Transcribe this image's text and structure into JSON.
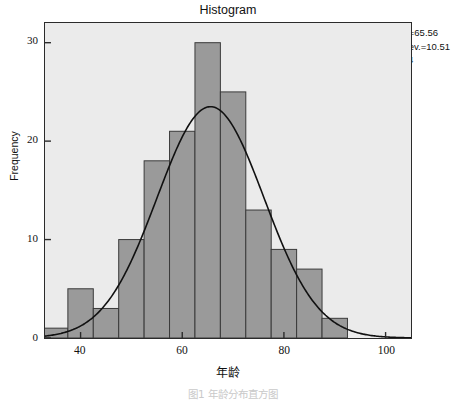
{
  "title": "Histogram",
  "stats": {
    "mean_label": "Mean=65.56",
    "stddev_label": "Std.Dev.=10.51",
    "n_label": "N=124"
  },
  "caption": "图1  年龄分布直方图",
  "colors": {
    "panel_background": "#ebebeb",
    "bar_fill": "#9a9a9a",
    "bar_stroke": "#3a3a3a",
    "curve": "#111111",
    "axis": "#2b2b2b",
    "text": "#111111"
  },
  "chart_data": {
    "type": "bar",
    "title": "Histogram",
    "xlabel": "年龄",
    "ylabel": "Frequency",
    "xlim": [
      33,
      105
    ],
    "ylim": [
      0,
      32
    ],
    "xticks": [
      40,
      60,
      80,
      100
    ],
    "yticks": [
      0,
      10,
      20,
      30
    ],
    "grid": false,
    "legend": false,
    "bin_width": 5,
    "bin_edges": [
      32.5,
      37.5,
      42.5,
      47.5,
      52.5,
      57.5,
      62.5,
      67.5,
      72.5,
      77.5,
      82.5,
      87.5,
      92.5
    ],
    "categories": [
      "32.5-37.5",
      "37.5-42.5",
      "42.5-47.5",
      "47.5-52.5",
      "52.5-57.5",
      "57.5-62.5",
      "62.5-67.5",
      "67.5-72.5",
      "72.5-77.5",
      "77.5-82.5",
      "82.5-87.5",
      "87.5-92.5"
    ],
    "values": [
      1,
      5,
      3,
      10,
      18,
      21,
      30,
      25,
      13,
      9,
      7,
      2
    ],
    "overlay": {
      "type": "normal-curve",
      "mean": 65.56,
      "stddev": 10.51,
      "n": 124,
      "peak_frequency": 23.5
    },
    "annotations": [
      "Mean=65.56",
      "Std.Dev.=10.51",
      "N=124"
    ]
  }
}
